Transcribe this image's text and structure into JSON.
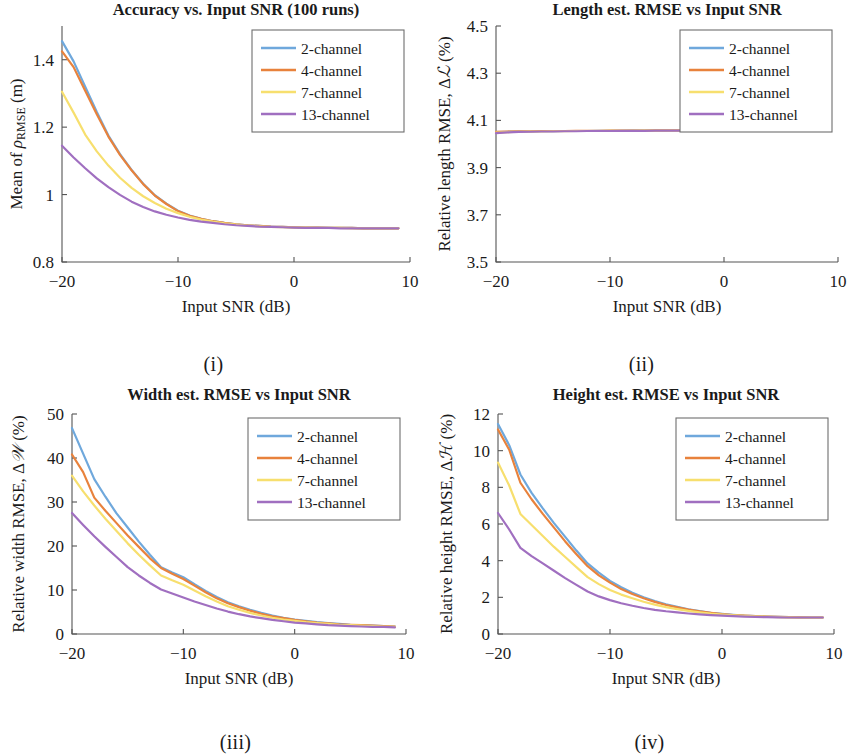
{
  "figure": {
    "panels": [
      "i",
      "ii",
      "iii",
      "iv"
    ]
  },
  "captions": {
    "i": "(i)",
    "ii": "(ii)",
    "iii": "(iii)",
    "iv": "(iv)"
  },
  "legend": {
    "entries": [
      "2-channel",
      "4-channel",
      "7-channel",
      "13-channel"
    ],
    "colors": [
      "#6fa8dc",
      "#e8823c",
      "#f7df6e",
      "#a06fc0"
    ]
  },
  "colors": {
    "series_2ch": "#6fa8dc",
    "series_4ch": "#e8823c",
    "series_7ch": "#f7df6e",
    "series_13ch": "#a06fc0",
    "axis": "#555555",
    "text": "#1a1a1a",
    "background": "#ffffff"
  },
  "chart_data": [
    {
      "panel": "i",
      "type": "line",
      "title": "Accuracy vs. Input SNR (100 runs)",
      "xlabel": "Input SNR (dB)",
      "ylabel": "Mean of ρRMSE (m)",
      "ylabel_parts": {
        "prefix": "Mean of ",
        "symbol": "ρ",
        "subscript": "RMSE",
        "suffix": " (m)"
      },
      "xlim": [
        -20,
        10
      ],
      "ylim": [
        0.8,
        1.5
      ],
      "xticks": [
        -20,
        -10,
        0,
        10
      ],
      "xticklabels": [
        "−20",
        "−10",
        "0",
        "10"
      ],
      "yticks": [
        0.8,
        1.0,
        1.2,
        1.4
      ],
      "yticklabels": [
        "0.8",
        "1",
        "1.2",
        "1.4"
      ],
      "grid": false,
      "legend_position": "upper right",
      "x": [
        -20,
        -19,
        -18,
        -17,
        -16,
        -15,
        -14,
        -13,
        -12,
        -11,
        -10,
        -9,
        -8,
        -7,
        -6,
        -5,
        -4,
        -3,
        -2,
        -1,
        0,
        1,
        2,
        3,
        4,
        5,
        6,
        7,
        8,
        9
      ],
      "series": [
        {
          "name": "2-channel",
          "values": [
            1.455,
            1.395,
            1.32,
            1.245,
            1.175,
            1.12,
            1.073,
            1.032,
            0.998,
            0.973,
            0.952,
            0.938,
            0.928,
            0.921,
            0.916,
            0.912,
            0.909,
            0.907,
            0.905,
            0.904,
            0.903,
            0.902,
            0.902,
            0.901,
            0.901,
            0.901,
            0.9,
            0.9,
            0.9,
            0.9
          ]
        },
        {
          "name": "4-channel",
          "values": [
            1.425,
            1.378,
            1.308,
            1.238,
            1.172,
            1.118,
            1.072,
            1.031,
            0.997,
            0.972,
            0.951,
            0.937,
            0.928,
            0.921,
            0.916,
            0.912,
            0.909,
            0.907,
            0.905,
            0.904,
            0.903,
            0.902,
            0.902,
            0.901,
            0.901,
            0.901,
            0.9,
            0.9,
            0.9,
            0.9
          ]
        },
        {
          "name": "7-channel",
          "values": [
            1.305,
            1.243,
            1.178,
            1.128,
            1.086,
            1.05,
            1.02,
            0.995,
            0.975,
            0.958,
            0.945,
            0.934,
            0.926,
            0.92,
            0.915,
            0.911,
            0.908,
            0.906,
            0.904,
            0.903,
            0.902,
            0.902,
            0.901,
            0.901,
            0.901,
            0.9,
            0.9,
            0.9,
            0.9,
            0.9
          ]
        },
        {
          "name": "13-channel",
          "values": [
            1.145,
            1.11,
            1.078,
            1.048,
            1.022,
            0.999,
            0.979,
            0.963,
            0.95,
            0.94,
            0.932,
            0.925,
            0.92,
            0.916,
            0.912,
            0.909,
            0.907,
            0.905,
            0.904,
            0.903,
            0.902,
            0.901,
            0.901,
            0.901,
            0.9,
            0.9,
            0.9,
            0.9,
            0.9,
            0.9
          ]
        }
      ]
    },
    {
      "panel": "ii",
      "type": "line",
      "title": "Length est. RMSE vs Input SNR",
      "xlabel": "Input SNR (dB)",
      "ylabel": "Relative length RMSE, Δℒ (%)",
      "ylabel_parts": {
        "prefix": "Relative length RMSE, Δ",
        "symbol": "ℒ",
        "suffix": " (%)"
      },
      "xlim": [
        -20,
        10
      ],
      "ylim": [
        3.5,
        4.5
      ],
      "xticks": [
        -20,
        -10,
        0,
        10
      ],
      "xticklabels": [
        "−20",
        "−10",
        "0",
        "10"
      ],
      "yticks": [
        3.5,
        3.7,
        3.9,
        4.1,
        4.3,
        4.5
      ],
      "yticklabels": [
        "3.5",
        "3.7",
        "3.9",
        "4.1",
        "4.3",
        "4.5"
      ],
      "grid": false,
      "legend_position": "upper right",
      "x": [
        -20,
        -19,
        -18,
        -17,
        -16,
        -15,
        -14,
        -13,
        -12,
        -11,
        -10,
        -9,
        -8,
        -7,
        -6,
        -5,
        -4,
        -3,
        -2,
        -1,
        0,
        1,
        2,
        3,
        4,
        5,
        6,
        7,
        8,
        9
      ],
      "series": [
        {
          "name": "2-channel",
          "values": [
            4.05,
            4.052,
            4.053,
            4.053,
            4.054,
            4.054,
            4.055,
            4.055,
            4.055,
            4.056,
            4.056,
            4.056,
            4.057,
            4.057,
            4.057,
            4.057,
            4.058,
            4.058,
            4.058,
            4.058,
            4.058,
            4.059,
            4.059,
            4.059,
            4.059,
            4.059,
            4.06,
            4.06,
            4.06,
            4.06
          ]
        },
        {
          "name": "4-channel",
          "values": [
            4.052,
            4.053,
            4.054,
            4.054,
            4.055,
            4.055,
            4.055,
            4.056,
            4.056,
            4.056,
            4.057,
            4.057,
            4.057,
            4.057,
            4.058,
            4.058,
            4.058,
            4.058,
            4.058,
            4.059,
            4.059,
            4.059,
            4.059,
            4.059,
            4.06,
            4.06,
            4.06,
            4.06,
            4.06,
            4.06
          ]
        },
        {
          "name": "7-channel",
          "values": [
            4.048,
            4.05,
            4.052,
            4.053,
            4.053,
            4.054,
            4.054,
            4.055,
            4.055,
            4.055,
            4.056,
            4.056,
            4.056,
            4.057,
            4.057,
            4.057,
            4.057,
            4.058,
            4.058,
            4.058,
            4.058,
            4.058,
            4.059,
            4.059,
            4.059,
            4.059,
            4.06,
            4.06,
            4.06,
            4.06
          ]
        },
        {
          "name": "13-channel",
          "values": [
            4.046,
            4.049,
            4.051,
            4.052,
            4.053,
            4.053,
            4.054,
            4.054,
            4.055,
            4.055,
            4.055,
            4.056,
            4.056,
            4.056,
            4.057,
            4.057,
            4.057,
            4.057,
            4.058,
            4.058,
            4.058,
            4.058,
            4.059,
            4.059,
            4.059,
            4.059,
            4.059,
            4.06,
            4.06,
            4.06
          ]
        }
      ]
    },
    {
      "panel": "iii",
      "type": "line",
      "title": "Width est. RMSE vs Input SNR",
      "xlabel": "Input SNR (dB)",
      "ylabel": "Relative width RMSE, Δ𝒲 (%)",
      "ylabel_parts": {
        "prefix": "Relative width RMSE, Δ",
        "symbol": "𝒲",
        "suffix": " (%)"
      },
      "xlim": [
        -20,
        10
      ],
      "ylim": [
        0,
        50
      ],
      "xticks": [
        -20,
        -10,
        0,
        10
      ],
      "xticklabels": [
        "−20",
        "−10",
        "0",
        "10"
      ],
      "yticks": [
        0,
        10,
        20,
        30,
        40,
        50
      ],
      "yticklabels": [
        "0",
        "10",
        "20",
        "30",
        "40",
        "50"
      ],
      "grid": false,
      "legend_position": "upper right",
      "x": [
        -20,
        -19,
        -18,
        -17,
        -16,
        -15,
        -14,
        -13,
        -12,
        -11,
        -10,
        -9,
        -8,
        -7,
        -6,
        -5,
        -4,
        -3,
        -2,
        -1,
        0,
        1,
        2,
        3,
        4,
        5,
        6,
        7,
        8,
        9
      ],
      "series": [
        {
          "name": "2-channel",
          "values": [
            46.8,
            41.0,
            35.2,
            31.2,
            27.4,
            24.2,
            21.0,
            18.0,
            15.2,
            14.0,
            12.9,
            11.3,
            9.8,
            8.4,
            7.2,
            6.3,
            5.5,
            4.8,
            4.2,
            3.7,
            3.3,
            3.0,
            2.7,
            2.5,
            2.3,
            2.1,
            2.0,
            1.9,
            1.8,
            1.7
          ]
        },
        {
          "name": "4-channel",
          "values": [
            40.8,
            36.8,
            31.0,
            28.0,
            25.2,
            22.4,
            19.8,
            17.2,
            15.0,
            13.7,
            12.5,
            11.0,
            9.5,
            8.1,
            7.0,
            6.1,
            5.3,
            4.6,
            4.0,
            3.6,
            3.2,
            2.9,
            2.6,
            2.4,
            2.2,
            2.1,
            2.0,
            1.9,
            1.8,
            1.7
          ]
        },
        {
          "name": "7-channel",
          "values": [
            36.0,
            32.4,
            29.2,
            26.2,
            23.4,
            20.6,
            18.0,
            15.6,
            13.3,
            12.2,
            11.2,
            9.9,
            8.6,
            7.4,
            6.3,
            5.5,
            4.8,
            4.2,
            3.7,
            3.3,
            3.0,
            2.7,
            2.5,
            2.3,
            2.1,
            2.0,
            1.9,
            1.8,
            1.7,
            1.6
          ]
        },
        {
          "name": "13-channel",
          "values": [
            27.5,
            24.8,
            22.2,
            19.8,
            17.5,
            15.2,
            13.3,
            11.6,
            10.1,
            9.2,
            8.3,
            7.4,
            6.6,
            5.8,
            5.1,
            4.5,
            4.0,
            3.6,
            3.2,
            2.9,
            2.6,
            2.4,
            2.2,
            2.0,
            1.9,
            1.8,
            1.7,
            1.6,
            1.6,
            1.5
          ]
        }
      ]
    },
    {
      "panel": "iv",
      "type": "line",
      "title": "Height est. RMSE vs Input SNR",
      "xlabel": "Input SNR (dB)",
      "ylabel": "Relative height RMSE, Δℋ (%)",
      "ylabel_parts": {
        "prefix": "Relative height RMSE, Δ",
        "symbol": "ℋ",
        "suffix": " (%)"
      },
      "xlim": [
        -20,
        10
      ],
      "ylim": [
        0,
        12
      ],
      "xticks": [
        -20,
        -10,
        0,
        10
      ],
      "xticklabels": [
        "−20",
        "−10",
        "0",
        "10"
      ],
      "yticks": [
        0,
        2,
        4,
        6,
        8,
        10,
        12
      ],
      "yticklabels": [
        "0",
        "2",
        "4",
        "6",
        "8",
        "10",
        "12"
      ],
      "grid": false,
      "legend_position": "upper right",
      "x": [
        -20,
        -19,
        -18,
        -17,
        -16,
        -15,
        -14,
        -13,
        -12,
        -11,
        -10,
        -9,
        -8,
        -7,
        -6,
        -5,
        -4,
        -3,
        -2,
        -1,
        0,
        1,
        2,
        3,
        4,
        5,
        6,
        7,
        8,
        9
      ],
      "series": [
        {
          "name": "2-channel",
          "values": [
            11.45,
            10.3,
            8.7,
            7.7,
            6.85,
            6.05,
            5.3,
            4.55,
            3.85,
            3.35,
            2.9,
            2.55,
            2.25,
            2.0,
            1.8,
            1.62,
            1.48,
            1.35,
            1.25,
            1.16,
            1.1,
            1.05,
            1.0,
            0.98,
            0.95,
            0.93,
            0.92,
            0.91,
            0.9,
            0.9
          ]
        },
        {
          "name": "4-channel",
          "values": [
            11.15,
            10.05,
            8.25,
            7.35,
            6.55,
            5.8,
            5.05,
            4.35,
            3.7,
            3.2,
            2.8,
            2.45,
            2.18,
            1.95,
            1.75,
            1.58,
            1.45,
            1.33,
            1.23,
            1.15,
            1.08,
            1.03,
            1.0,
            0.97,
            0.95,
            0.93,
            0.92,
            0.91,
            0.9,
            0.9
          ]
        },
        {
          "name": "7-channel",
          "values": [
            9.35,
            8.1,
            6.55,
            5.95,
            5.35,
            4.75,
            4.2,
            3.65,
            3.1,
            2.72,
            2.4,
            2.15,
            1.95,
            1.76,
            1.6,
            1.47,
            1.36,
            1.26,
            1.18,
            1.11,
            1.06,
            1.02,
            0.99,
            0.96,
            0.94,
            0.92,
            0.91,
            0.9,
            0.9,
            0.9
          ]
        },
        {
          "name": "13-channel",
          "values": [
            6.6,
            5.7,
            4.7,
            4.25,
            3.85,
            3.45,
            3.05,
            2.68,
            2.32,
            2.05,
            1.85,
            1.68,
            1.54,
            1.42,
            1.32,
            1.24,
            1.18,
            1.12,
            1.07,
            1.03,
            1.0,
            0.97,
            0.95,
            0.93,
            0.92,
            0.91,
            0.9,
            0.9,
            0.9,
            0.9
          ]
        }
      ]
    }
  ]
}
